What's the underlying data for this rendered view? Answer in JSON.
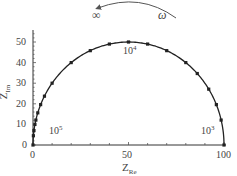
{
  "chart_data": {
    "type": "scatter",
    "title": "",
    "xlabel": "Z_Re",
    "ylabel": "Z_Im",
    "xlim": [
      0,
      100
    ],
    "ylim": [
      0,
      55
    ],
    "x_ticks": [
      0,
      50,
      100
    ],
    "y_ticks": [
      0,
      10,
      20,
      30,
      40,
      50
    ],
    "grid": false,
    "series": [
      {
        "name": "Nyquist semicircle (R=100)",
        "style": "line with square markers",
        "x": [
          0,
          0.2,
          0.5,
          1.0,
          1.5,
          2.5,
          4.0,
          6.0,
          10.0,
          20.0,
          30.0,
          40.0,
          50.0,
          60.0,
          70.0,
          80.0,
          86.0,
          92.0,
          96.0,
          98.5,
          100
        ],
        "y": [
          0,
          4.5,
          7.0,
          10.0,
          12.1,
          15.6,
          19.6,
          23.7,
          30.0,
          40.0,
          45.8,
          49.0,
          50.0,
          49.0,
          45.8,
          40.0,
          34.7,
          27.1,
          19.6,
          12.1,
          0
        ]
      }
    ],
    "annotations": [
      {
        "text": "10^5",
        "x": 13,
        "y": 10
      },
      {
        "text": "10^4",
        "x": 50,
        "y": 46
      },
      {
        "text": "10^3",
        "x": 92,
        "y": 10
      },
      {
        "text": "∞",
        "position": "top-left arrow end"
      },
      {
        "text": "ω",
        "position": "top-right arrow start"
      }
    ],
    "arrow": {
      "from": "ω",
      "to": "∞",
      "direction": "counter-clockwise arc"
    }
  },
  "labels": {
    "y_axis": "Z",
    "y_axis_sub": "Im",
    "x_axis": "Z",
    "x_axis_sub": "Re",
    "x_tick_0": "0",
    "x_tick_50": "50",
    "x_tick_100": "100",
    "y_tick_0": "0",
    "y_tick_10": "10",
    "y_tick_20": "20",
    "y_tick_30": "30",
    "y_tick_40": "40",
    "y_tick_50": "50",
    "ann_1e5_base": "10",
    "ann_1e5_exp": "5",
    "ann_1e4_base": "10",
    "ann_1e4_exp": "4",
    "ann_1e3_base": "10",
    "ann_1e3_exp": "3",
    "infinity": "∞",
    "omega": "ω"
  }
}
